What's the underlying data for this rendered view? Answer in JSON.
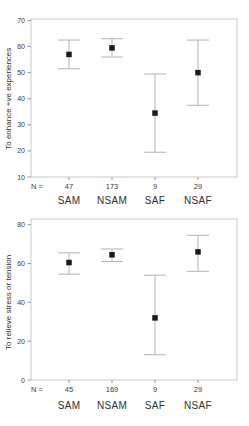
{
  "chart_data": [
    {
      "type": "scatter",
      "subtype": "mean-error-bar-plot",
      "title": "",
      "xlabel": "",
      "ylabel": "To enhance +ve experiences",
      "ylim": [
        10,
        70
      ],
      "yticks": [
        10,
        20,
        30,
        40,
        50,
        60,
        70
      ],
      "grid": false,
      "legend": null,
      "n_prefix": "N =",
      "categories": [
        "SAM",
        "NSAM",
        "SAF",
        "NSAF"
      ],
      "points": [
        {
          "category": "SAM",
          "n": 47,
          "mean": 57,
          "ci_low": 51.5,
          "ci_high": 62.5
        },
        {
          "category": "NSAM",
          "n": 173,
          "mean": 59.5,
          "ci_low": 56,
          "ci_high": 63
        },
        {
          "category": "SAF",
          "n": 9,
          "mean": 34.5,
          "ci_low": 19.5,
          "ci_high": 49.5
        },
        {
          "category": "NSAF",
          "n": 29,
          "mean": 50,
          "ci_low": 37.5,
          "ci_high": 62.5
        }
      ]
    },
    {
      "type": "scatter",
      "subtype": "mean-error-bar-plot",
      "title": "",
      "xlabel": "",
      "ylabel": "To relieve stress or tension",
      "ylim": [
        0,
        80
      ],
      "yticks": [
        0,
        20,
        40,
        60,
        80
      ],
      "grid": false,
      "legend": null,
      "n_prefix": "N =",
      "categories": [
        "SAM",
        "NSAM",
        "SAF",
        "NSAF"
      ],
      "points": [
        {
          "category": "SAM",
          "n": 45,
          "mean": 60.5,
          "ci_low": 54.5,
          "ci_high": 65.5
        },
        {
          "category": "NSAM",
          "n": 169,
          "mean": 64.5,
          "ci_low": 61,
          "ci_high": 67.5
        },
        {
          "category": "SAF",
          "n": 9,
          "mean": 32,
          "ci_low": 13,
          "ci_high": 54
        },
        {
          "category": "NSAF",
          "n": 29,
          "mean": 66,
          "ci_low": 56,
          "ci_high": 74.5
        }
      ]
    }
  ],
  "colors": {
    "background": "#ffffff",
    "frame": "#c9c9c9",
    "axis_tick": "#999999",
    "error_bar": "#b3b3b3",
    "marker": "#1b1b1b",
    "tick_text": "#3a3a3a",
    "label_text": "#303030"
  }
}
